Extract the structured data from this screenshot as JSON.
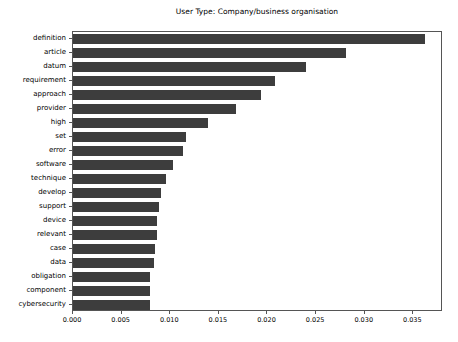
{
  "chart_data": {
    "type": "bar",
    "orientation": "horizontal",
    "title": "User Type: Company/business organisation",
    "xlabel": "",
    "ylabel": "",
    "xlim": [
      0.0,
      0.03805
    ],
    "xticks": [
      "0.000",
      "0.005",
      "0.010",
      "0.015",
      "0.020",
      "0.025",
      "0.030",
      "0.035"
    ],
    "xtick_values": [
      0.0,
      0.005,
      0.01,
      0.015,
      0.02,
      0.025,
      0.03,
      0.035
    ],
    "grid": false,
    "legend": null,
    "bar_color": "#3d3d3d",
    "categories": [
      "definition",
      "article",
      "datum",
      "requirement",
      "approach",
      "provider",
      "high",
      "set",
      "error",
      "software",
      "technique",
      "develop",
      "support",
      "device",
      "relevant",
      "case",
      "data",
      "obligation",
      "component",
      "cybersecurity"
    ],
    "values": [
      0.0362,
      0.0281,
      0.024,
      0.0208,
      0.0193,
      0.0168,
      0.0139,
      0.0116,
      0.0113,
      0.0103,
      0.0096,
      0.0091,
      0.0088,
      0.0086,
      0.0086,
      0.0084,
      0.0083,
      0.0079,
      0.0079,
      0.0079
    ]
  }
}
